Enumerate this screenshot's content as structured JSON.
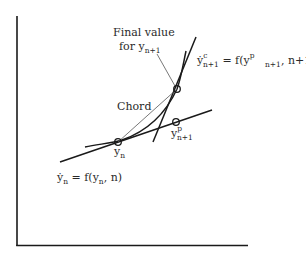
{
  "diagram": {
    "type": "predictor-corrector illustration",
    "axes": {
      "x_axis": "horizontal baseline",
      "y_axis": "vertical axis"
    },
    "colors": {
      "ink": "#1a1a1a",
      "thin_line": "#555555",
      "text": "#2a2a2a"
    },
    "labels": {
      "final_value_line1": "Final value",
      "final_value_line2_main": "for y",
      "final_value_line2_sub": "n+1",
      "chord": "Chord",
      "yn_main": "y",
      "yn_sub": "n",
      "ypred_main": "y",
      "ypred_sup": "p",
      "ypred_sub": "n+1",
      "deriv_n_lhs_main": "ẏ",
      "deriv_n_lhs_sub": "n",
      "deriv_n_eq": " = f(y",
      "deriv_n_arg_sub": "n",
      "deriv_n_tail": ", n)",
      "deriv_c_lhs_main": "ẏ",
      "deriv_c_lhs_sup": "c",
      "deriv_c_lhs_sub": "n+1",
      "deriv_c_eq": " = f(y",
      "deriv_c_arg_sup": "p",
      "deriv_c_arg_sub": "n+1",
      "deriv_c_tail": ", n+1)"
    },
    "points": [
      {
        "name": "y_n",
        "x": 118,
        "y": 142
      },
      {
        "name": "y_p_n+1",
        "x": 176,
        "y": 122
      },
      {
        "name": "final_y_n+1",
        "x": 177,
        "y": 89
      }
    ]
  }
}
